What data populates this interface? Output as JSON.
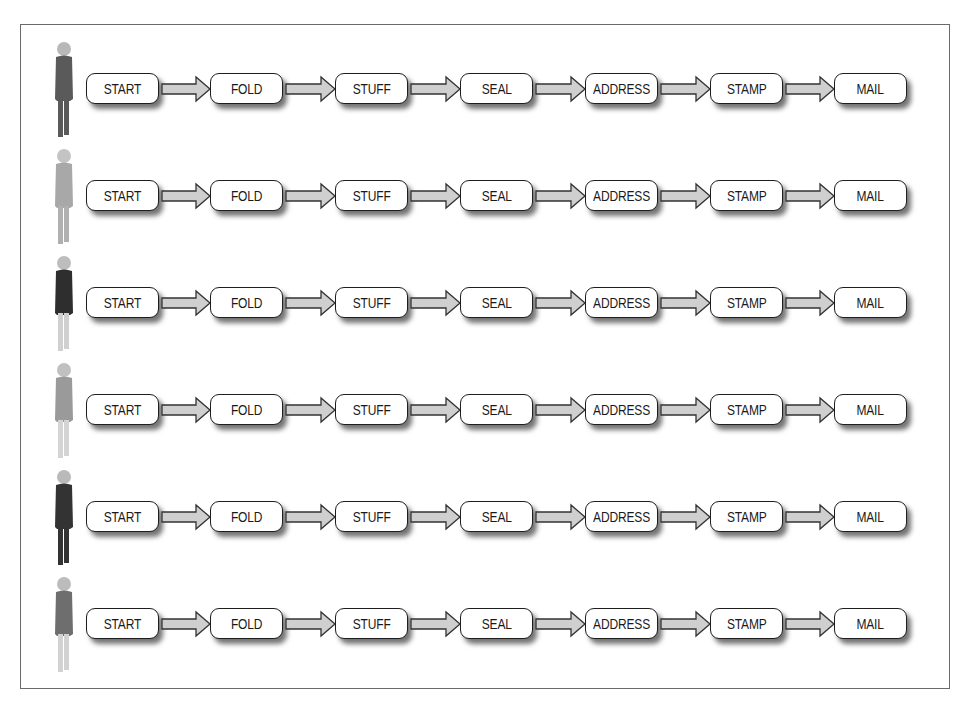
{
  "diagram": {
    "type": "process-flow",
    "steps": [
      "START",
      "FOLD",
      "STUFF",
      "SEAL",
      "ADDRESS",
      "STAMP",
      "MAIL"
    ],
    "rows": [
      {
        "worker": {
          "label": "worker-1",
          "body_color": "#5a5a5a",
          "legs_color": "#5a5a5a",
          "head_color": "#b8b8b8"
        },
        "steps": [
          "START",
          "FOLD",
          "STUFF",
          "SEAL",
          "ADDRESS",
          "STAMP",
          "MAIL"
        ]
      },
      {
        "worker": {
          "label": "worker-2",
          "body_color": "#a8a8a8",
          "legs_color": "#b0b0b0",
          "head_color": "#c4c4c4"
        },
        "steps": [
          "START",
          "FOLD",
          "STUFF",
          "SEAL",
          "ADDRESS",
          "STAMP",
          "MAIL"
        ]
      },
      {
        "worker": {
          "label": "worker-3",
          "body_color": "#2e2e2e",
          "legs_color": "#d0d0d0",
          "head_color": "#bdbdbd"
        },
        "steps": [
          "START",
          "FOLD",
          "STUFF",
          "SEAL",
          "ADDRESS",
          "STAMP",
          "MAIL"
        ]
      },
      {
        "worker": {
          "label": "worker-4",
          "body_color": "#9a9a9a",
          "legs_color": "#d4d4d4",
          "head_color": "#c0c0c0"
        },
        "steps": [
          "START",
          "FOLD",
          "STUFF",
          "SEAL",
          "ADDRESS",
          "STAMP",
          "MAIL"
        ]
      },
      {
        "worker": {
          "label": "worker-5",
          "body_color": "#333333",
          "legs_color": "#333333",
          "head_color": "#bababa"
        },
        "steps": [
          "START",
          "FOLD",
          "STUFF",
          "SEAL",
          "ADDRESS",
          "STAMP",
          "MAIL"
        ]
      },
      {
        "worker": {
          "label": "worker-6",
          "body_color": "#6e6e6e",
          "legs_color": "#d2d2d2",
          "head_color": "#bcbcbc"
        },
        "steps": [
          "START",
          "FOLD",
          "STUFF",
          "SEAL",
          "ADDRESS",
          "STAMP",
          "MAIL"
        ]
      }
    ],
    "colors": {
      "frame_border": "#6a6a6a",
      "box_border": "#1e1e1e",
      "box_fill": "#ffffff",
      "arrow_fill": "#cfcfcf",
      "arrow_border": "#333333"
    }
  },
  "caption": {
    "text": "",
    "note": "caption text below frame is cut off at image bottom"
  }
}
